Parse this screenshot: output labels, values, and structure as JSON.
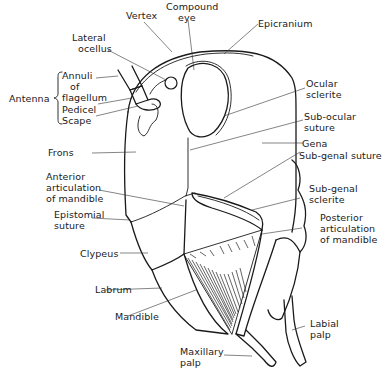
{
  "diagram": {
    "labels": {
      "vertex": "Vertex",
      "compound_eye_1": "Compound",
      "compound_eye_2": "eye",
      "epicranium": "Epicranium",
      "lateral_ocellus_1": "Lateral",
      "lateral_ocellus_2": "ocellus",
      "antenna": "Antenna",
      "annuli_1": "Annuli",
      "annuli_2": "of",
      "annuli_3": "flagellum",
      "pedicel": "Pedicel",
      "scape": "Scape",
      "ocular_sclerite_1": "Ocular",
      "ocular_sclerite_2": "sclerite",
      "sub_ocular_suture_1": "Sub-ocular",
      "sub_ocular_suture_2": "suture",
      "gena": "Gena",
      "sub_genal_suture": "Sub-genal suture",
      "frons": "Frons",
      "anterior_articulation_1": "Anterior",
      "anterior_articulation_2": "articulation",
      "anterior_articulation_3": "of mandible",
      "sub_genal_sclerite_1": "Sub-genal",
      "sub_genal_sclerite_2": "sclerite",
      "epistomial_suture_1": "Epistomial",
      "epistomial_suture_2": "suture",
      "posterior_articulation_1": "Posterior",
      "posterior_articulation_2": "articulation",
      "posterior_articulation_3": "of mandible",
      "clypeus": "Clypeus",
      "labrum": "Labrum",
      "mandible": "Mandible",
      "labial_palp_1": "Labial",
      "labial_palp_2": "palp",
      "maxillary_palp_1": "Maxillary",
      "maxillary_palp_2": "palp"
    },
    "colors": {
      "ink": "#1a1a1a",
      "background": "#ffffff"
    }
  }
}
